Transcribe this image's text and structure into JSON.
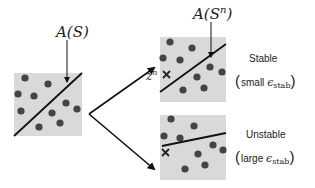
{
  "diagram": {
    "original": {
      "label": "A(S)",
      "box": {
        "x": 14,
        "y": 73,
        "w": 68,
        "h": 63
      },
      "fill": "#d9d9d9",
      "dot_color": "#444444",
      "dots": [
        [
          25,
          78
        ],
        [
          48,
          84
        ],
        [
          18,
          94
        ],
        [
          34,
          96
        ],
        [
          21,
          111
        ],
        [
          66,
          103
        ],
        [
          77,
          109
        ],
        [
          52,
          113
        ],
        [
          60,
          123
        ],
        [
          39,
          127
        ]
      ],
      "line": [
        [
          14,
          136
        ],
        [
          82,
          73
        ]
      ]
    },
    "stable": {
      "label_math": "A(S^n)",
      "perturbed_point_label": "z^n",
      "title": "Stable",
      "paren_text": "small",
      "epsilon": "ϵ",
      "epsilon_sub": "stab",
      "box": {
        "x": 160,
        "y": 37,
        "w": 66,
        "h": 65
      },
      "dots": [
        [
          170,
          42
        ],
        [
          192,
          48
        ],
        [
          163,
          58
        ],
        [
          180,
          60
        ],
        [
          210,
          67
        ],
        [
          222,
          72
        ],
        [
          197,
          77
        ],
        [
          204,
          88
        ],
        [
          183,
          90
        ]
      ],
      "line": [
        [
          160,
          92
        ],
        [
          226,
          44
        ]
      ],
      "x_marker": [
        166,
        74
      ]
    },
    "unstable": {
      "title": "Unstable",
      "paren_text": "large",
      "epsilon": "ϵ",
      "epsilon_sub": "stab",
      "box": {
        "x": 160,
        "y": 115,
        "w": 66,
        "h": 65
      },
      "dots": [
        [
          171,
          119
        ],
        [
          194,
          126
        ],
        [
          164,
          136
        ],
        [
          180,
          138
        ],
        [
          213,
          145
        ],
        [
          223,
          150
        ],
        [
          198,
          154
        ],
        [
          205,
          165
        ],
        [
          185,
          169
        ]
      ],
      "line": [
        [
          162,
          146
        ],
        [
          226,
          133
        ]
      ],
      "x_marker": [
        165,
        152
      ]
    },
    "arrows": {
      "color": "#111111",
      "origin": [
        89,
        114
      ],
      "up_end": [
        156,
        67
      ],
      "down_end": [
        156,
        170
      ]
    }
  }
}
